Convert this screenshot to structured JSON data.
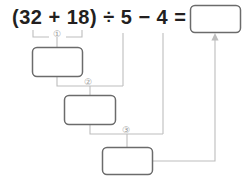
{
  "worksheet": {
    "equation": "(32 + 18) ÷ 5 − 4 =",
    "equation_parts": {
      "open_paren": "(",
      "operand_1": "32",
      "operator_1": "+",
      "operand_2": "18",
      "close_paren": ")",
      "operator_2": "÷",
      "operand_3": "5",
      "operator_3": "−",
      "operand_4": "4",
      "equals": "="
    },
    "answer_box": {
      "value": "",
      "placeholder": ""
    },
    "steps": [
      {
        "marker": "①",
        "expression": "32 + 18",
        "box_value": "",
        "placeholder": ""
      },
      {
        "marker": "②",
        "expression": "① ÷ 5",
        "box_value": "",
        "placeholder": ""
      },
      {
        "marker": "③",
        "expression": "② − 4",
        "box_value": "",
        "placeholder": ""
      }
    ],
    "colors": {
      "text": "#231f20",
      "box_stroke": "#6b6b6b",
      "connector": "#bdbdbd",
      "marker": "#9a9a9a",
      "background": "#ffffff"
    }
  }
}
